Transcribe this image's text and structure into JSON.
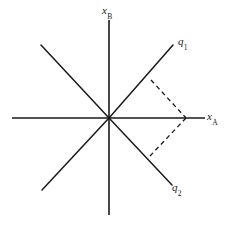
{
  "figure": {
    "background_color": "#ffffff",
    "line_color": "#1a1a1a",
    "axes": {
      "vertical": {
        "name": "x_B",
        "label_base": "x",
        "label_sub": "B",
        "x": 109,
        "y_top": 20,
        "y_bottom": 215
      },
      "horizontal": {
        "name": "x_A",
        "label_base": "x",
        "label_sub": "A",
        "y": 118,
        "x_left": 12,
        "x_right": 205
      }
    },
    "rays": [
      {
        "name": "q1",
        "label_base": "q",
        "label_sub": "1",
        "from_x": 109,
        "from_y": 118,
        "to_x": 173,
        "to_y": 45,
        "style": "solid"
      },
      {
        "name": "q1-extension",
        "label_base": "",
        "label_sub": "",
        "from_x": 109,
        "from_y": 118,
        "to_x": 42,
        "to_y": 190,
        "style": "solid"
      },
      {
        "name": "q2",
        "label_base": "q",
        "label_sub": "2",
        "from_x": 109,
        "from_y": 118,
        "to_x": 172,
        "to_y": 185,
        "style": "solid"
      },
      {
        "name": "q2-extension",
        "label_base": "",
        "label_sub": "",
        "from_x": 109,
        "from_y": 118,
        "to_x": 41,
        "to_y": 45,
        "style": "solid"
      }
    ],
    "dashed_lines": [
      {
        "name": "upper-projection",
        "from_x": 151,
        "from_y": 80,
        "to_x": 186,
        "to_y": 118,
        "style": "dashed"
      },
      {
        "name": "lower-projection",
        "from_x": 186,
        "from_y": 118,
        "to_x": 150,
        "to_y": 156,
        "style": "dashed"
      }
    ],
    "resultant_vertex": {
      "name": "resultant-point",
      "x": 186,
      "y": 118
    }
  }
}
